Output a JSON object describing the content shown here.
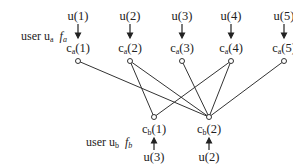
{
  "user_a": {
    "label": "user u",
    "sub": "a",
    "func": "f",
    "func_sub": "a",
    "inputs": [
      "u(1)",
      "u(2)",
      "u(3)",
      "u(4)",
      "u(5)"
    ],
    "nodes": [
      {
        "base": "c",
        "sub": "a",
        "idx": "(1)"
      },
      {
        "base": "c",
        "sub": "a",
        "idx": "(2)"
      },
      {
        "base": "c",
        "sub": "a",
        "idx": "(3)"
      },
      {
        "base": "c",
        "sub": "a",
        "idx": "(4)"
      },
      {
        "base": "c",
        "sub": "a",
        "idx": "(5)"
      }
    ]
  },
  "user_b": {
    "label": "user u",
    "sub": "b",
    "func": "f",
    "func_sub": "b",
    "inputs": [
      "u(3)",
      "u(2)"
    ],
    "nodes": [
      {
        "base": "c",
        "sub": "b",
        "idx": "(1)"
      },
      {
        "base": "c",
        "sub": "b",
        "idx": "(2)"
      }
    ]
  },
  "edges": [
    [
      "ca1",
      "cb2"
    ],
    [
      "ca2",
      "cb1"
    ],
    [
      "ca2",
      "cb2"
    ],
    [
      "ca3",
      "cb2"
    ],
    [
      "ca4",
      "cb1"
    ],
    [
      "ca4",
      "cb2"
    ],
    [
      "ca5",
      "cb2"
    ]
  ]
}
